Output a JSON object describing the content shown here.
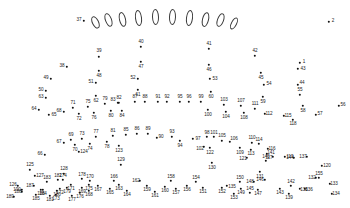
{
  "puzzle": {
    "title": "Connect the Dots Puzzle",
    "background_color": "#ffffff",
    "dot_color": "#111111",
    "label_color": "#1a1a1a",
    "outline_color": "#3a3a3a",
    "dot_count": 190,
    "shape_count": 10,
    "shapes": [
      {
        "name": "oval-1",
        "x": 95,
        "y": 22,
        "w": 6.5,
        "h": 13,
        "rot": -26
      },
      {
        "name": "oval-2",
        "x": 108,
        "y": 20,
        "w": 6.5,
        "h": 14,
        "rot": -20
      },
      {
        "name": "oval-3",
        "x": 122,
        "y": 19,
        "w": 6.8,
        "h": 15,
        "rot": -13
      },
      {
        "name": "oval-4",
        "x": 138,
        "y": 18,
        "w": 7.0,
        "h": 16,
        "rot": -7
      },
      {
        "name": "oval-5",
        "x": 155,
        "y": 17,
        "w": 7.0,
        "h": 16,
        "rot": -2
      },
      {
        "name": "oval-6",
        "x": 172,
        "y": 17,
        "w": 7.0,
        "h": 16,
        "rot": 2
      },
      {
        "name": "oval-7",
        "x": 189,
        "y": 18,
        "w": 7.0,
        "h": 16,
        "rot": 7
      },
      {
        "name": "oval-8",
        "x": 205,
        "y": 19,
        "w": 6.8,
        "h": 15,
        "rot": 13
      },
      {
        "name": "oval-9",
        "x": 220,
        "y": 20,
        "w": 6.5,
        "h": 14,
        "rot": 20
      },
      {
        "name": "oval-10",
        "x": 234,
        "y": 23,
        "w": 6.2,
        "h": 13,
        "rot": 27
      }
    ],
    "dots": [
      {
        "n": 1,
        "x": 300,
        "y": 63,
        "lx": 304,
        "ly": 61.5
      },
      {
        "n": 2,
        "x": 329,
        "y": 22,
        "lx": 333,
        "ly": 20.5
      },
      {
        "n": 37,
        "x": 84,
        "y": 21,
        "lx": 79,
        "ly": 20
      },
      {
        "n": 38,
        "x": 67,
        "y": 67,
        "lx": 62,
        "ly": 66
      },
      {
        "n": 39,
        "x": 99,
        "y": 57,
        "lx": 99,
        "ly": 51
      },
      {
        "n": 40,
        "x": 141,
        "y": 47,
        "lx": 141,
        "ly": 42
      },
      {
        "n": 41,
        "x": 209,
        "y": 49,
        "lx": 209,
        "ly": 44
      },
      {
        "n": 42,
        "x": 255,
        "y": 56,
        "lx": 255,
        "ly": 51
      },
      {
        "n": 43,
        "x": 298,
        "y": 69,
        "lx": 303,
        "ly": 69
      },
      {
        "n": 44,
        "x": 298,
        "y": 85,
        "lx": 302,
        "ly": 83
      },
      {
        "n": 45,
        "x": 261,
        "y": 73,
        "lx": 261,
        "ly": 78
      },
      {
        "n": 46,
        "x": 209,
        "y": 65,
        "lx": 209,
        "ly": 70
      },
      {
        "n": 47,
        "x": 141,
        "y": 62,
        "lx": 141,
        "ly": 67
      },
      {
        "n": 48,
        "x": 99,
        "y": 71,
        "lx": 99,
        "ly": 76
      },
      {
        "n": 49,
        "x": 51,
        "y": 79,
        "lx": 46,
        "ly": 78
      },
      {
        "n": 50,
        "x": 46,
        "y": 91,
        "lx": 41,
        "ly": 90
      },
      {
        "n": 51,
        "x": 96,
        "y": 83,
        "lx": 91,
        "ly": 82
      },
      {
        "n": 52,
        "x": 138,
        "y": 79,
        "lx": 133,
        "ly": 78
      },
      {
        "n": 53,
        "x": 210,
        "y": 79,
        "lx": 215,
        "ly": 79
      },
      {
        "n": 54,
        "x": 264,
        "y": 85,
        "lx": 269,
        "ly": 84
      },
      {
        "n": 55,
        "x": 300,
        "y": 95,
        "lx": 300,
        "ly": 90
      },
      {
        "n": 56,
        "x": 339,
        "y": 106,
        "lx": 343,
        "ly": 105
      },
      {
        "n": 57,
        "x": 316,
        "y": 115,
        "lx": 320,
        "ly": 114
      },
      {
        "n": 58,
        "x": 303,
        "y": 106,
        "lx": 303,
        "ly": 111
      },
      {
        "n": 59,
        "x": 263,
        "y": 97,
        "lx": 263,
        "ly": 102
      },
      {
        "n": 60,
        "x": 211,
        "y": 92,
        "lx": 211,
        "ly": 97
      },
      {
        "n": 61,
        "x": 138,
        "y": 90,
        "lx": 138,
        "ly": 95
      },
      {
        "n": 62,
        "x": 96,
        "y": 96,
        "lx": 96,
        "ly": 101
      },
      {
        "n": 63,
        "x": 46,
        "y": 98,
        "lx": 41,
        "ly": 97
      },
      {
        "n": 64,
        "x": 39,
        "y": 110,
        "lx": 34,
        "ly": 109
      },
      {
        "n": 65,
        "x": 49,
        "y": 115,
        "lx": 54,
        "ly": 115
      },
      {
        "n": 66,
        "x": 45,
        "y": 155,
        "lx": 40,
        "ly": 154
      },
      {
        "n": 67,
        "x": 64,
        "y": 143,
        "lx": 59,
        "ly": 142
      },
      {
        "n": 68,
        "x": 64,
        "y": 112,
        "lx": 59,
        "ly": 111
      },
      {
        "n": 69,
        "x": 71,
        "y": 140,
        "lx": 71,
        "ly": 135
      },
      {
        "n": 70,
        "x": 75,
        "y": 145,
        "lx": 75,
        "ly": 150
      },
      {
        "n": 71,
        "x": 73,
        "y": 108,
        "lx": 73,
        "ly": 103
      },
      {
        "n": 72,
        "x": 79,
        "y": 114,
        "lx": 79,
        "ly": 119
      },
      {
        "n": 73,
        "x": 82,
        "y": 139,
        "lx": 82,
        "ly": 134
      },
      {
        "n": 74,
        "x": 90,
        "y": 144,
        "lx": 90,
        "ly": 149
      },
      {
        "n": 75,
        "x": 88,
        "y": 107,
        "lx": 88,
        "ly": 102
      },
      {
        "n": 76,
        "x": 94,
        "y": 113,
        "lx": 94,
        "ly": 118
      },
      {
        "n": 77,
        "x": 96,
        "y": 137,
        "lx": 96,
        "ly": 132
      },
      {
        "n": 78,
        "x": 107,
        "y": 142,
        "lx": 107,
        "ly": 147
      },
      {
        "n": 79,
        "x": 105,
        "y": 104,
        "lx": 105,
        "ly": 99
      },
      {
        "n": 80,
        "x": 111,
        "y": 111,
        "lx": 111,
        "ly": 116
      },
      {
        "n": 81,
        "x": 113,
        "y": 136,
        "lx": 113,
        "ly": 131
      },
      {
        "n": 82,
        "x": 119,
        "y": 103,
        "lx": 119,
        "ly": 98
      },
      {
        "n": 83,
        "x": 118,
        "y": 103,
        "lx": 113,
        "ly": 100
      },
      {
        "n": 84,
        "x": 122,
        "y": 111,
        "lx": 122,
        "ly": 116
      },
      {
        "n": 85,
        "x": 126,
        "y": 135,
        "lx": 126,
        "ly": 130
      },
      {
        "n": 86,
        "x": 137,
        "y": 134,
        "lx": 137,
        "ly": 129
      },
      {
        "n": 87,
        "x": 135,
        "y": 102,
        "lx": 135,
        "ly": 97
      },
      {
        "n": 88,
        "x": 145,
        "y": 102,
        "lx": 145,
        "ly": 97
      },
      {
        "n": 89,
        "x": 148,
        "y": 134,
        "lx": 148,
        "ly": 129
      },
      {
        "n": 90,
        "x": 157,
        "y": 138,
        "lx": 161,
        "ly": 137
      },
      {
        "n": 91,
        "x": 158,
        "y": 102,
        "lx": 158,
        "ly": 97
      },
      {
        "n": 92,
        "x": 167,
        "y": 102,
        "lx": 167,
        "ly": 97
      },
      {
        "n": 93,
        "x": 172,
        "y": 137,
        "lx": 172,
        "ly": 132
      },
      {
        "n": 94,
        "x": 180,
        "y": 141,
        "lx": 180,
        "ly": 146
      },
      {
        "n": 95,
        "x": 180,
        "y": 102,
        "lx": 180,
        "ly": 97
      },
      {
        "n": 96,
        "x": 189,
        "y": 102,
        "lx": 189,
        "ly": 97
      },
      {
        "n": 97,
        "x": 193,
        "y": 139,
        "lx": 198,
        "ly": 139
      },
      {
        "n": 98,
        "x": 207,
        "y": 137,
        "lx": 207,
        "ly": 133
      },
      {
        "n": 99,
        "x": 201,
        "y": 102,
        "lx": 201,
        "ly": 97
      },
      {
        "n": 100,
        "x": 208,
        "y": 110,
        "lx": 208,
        "ly": 115
      },
      {
        "n": 101,
        "x": 214,
        "y": 137,
        "lx": 214,
        "ly": 133
      },
      {
        "n": 102,
        "x": 204,
        "y": 147,
        "lx": 200,
        "ly": 149
      },
      {
        "n": 103,
        "x": 224,
        "y": 105,
        "lx": 224,
        "ly": 100
      },
      {
        "n": 104,
        "x": 226,
        "y": 112,
        "lx": 226,
        "ly": 117
      },
      {
        "n": 105,
        "x": 222,
        "y": 141,
        "lx": 222,
        "ly": 136
      },
      {
        "n": 106,
        "x": 230,
        "y": 142,
        "lx": 234,
        "ly": 139
      },
      {
        "n": 107,
        "x": 241,
        "y": 106,
        "lx": 241,
        "ly": 101
      },
      {
        "n": 108,
        "x": 244,
        "y": 113,
        "lx": 244,
        "ly": 118
      },
      {
        "n": 109,
        "x": 240,
        "y": 148,
        "lx": 240,
        "ly": 153
      },
      {
        "n": 110,
        "x": 252,
        "y": 143,
        "lx": 252,
        "ly": 138
      },
      {
        "n": 111,
        "x": 255,
        "y": 109,
        "lx": 255,
        "ly": 104
      },
      {
        "n": 112,
        "x": 265,
        "y": 114,
        "lx": 269,
        "ly": 114
      },
      {
        "n": 113,
        "x": 251,
        "y": 150,
        "lx": 251,
        "ly": 154
      },
      {
        "n": 114,
        "x": 259,
        "y": 144,
        "lx": 259,
        "ly": 140
      },
      {
        "n": 115,
        "x": 284,
        "y": 116,
        "lx": 288,
        "ly": 116
      },
      {
        "n": 116,
        "x": 268,
        "y": 149,
        "lx": 272,
        "ly": 149
      },
      {
        "n": 117,
        "x": 273,
        "y": 157,
        "lx": 269,
        "ly": 158
      },
      {
        "n": 118,
        "x": 293,
        "y": 120,
        "lx": 293,
        "ly": 124
      },
      {
        "n": 119,
        "x": 285,
        "y": 157,
        "lx": 290,
        "ly": 157
      },
      {
        "n": 120,
        "x": 322,
        "y": 166,
        "lx": 327,
        "ly": 166
      },
      {
        "n": 121,
        "x": 247,
        "y": 158,
        "lx": 243,
        "ly": 159
      },
      {
        "n": 122,
        "x": 210,
        "y": 148,
        "lx": 210,
        "ly": 153
      },
      {
        "n": 123,
        "x": 119,
        "y": 146,
        "lx": 119,
        "ly": 151
      },
      {
        "n": 124,
        "x": 79,
        "y": 152,
        "lx": 84,
        "ly": 152
      },
      {
        "n": 125,
        "x": 30,
        "y": 170,
        "lx": 30,
        "ly": 165
      },
      {
        "n": 126,
        "x": 18,
        "y": 186,
        "lx": 13,
        "ly": 185
      },
      {
        "n": 127,
        "x": 35,
        "y": 176,
        "lx": 40,
        "ly": 176
      },
      {
        "n": 128,
        "x": 64,
        "y": 174,
        "lx": 64,
        "ly": 169
      },
      {
        "n": 129,
        "x": 121,
        "y": 165,
        "lx": 121,
        "ly": 160
      },
      {
        "n": 130,
        "x": 212,
        "y": 163,
        "lx": 212,
        "ly": 168
      },
      {
        "n": 131,
        "x": 260,
        "y": 172,
        "lx": 260,
        "ly": 177
      },
      {
        "n": 132,
        "x": 316,
        "y": 178,
        "lx": 312,
        "ly": 178
      },
      {
        "n": 133,
        "x": 330,
        "y": 184,
        "lx": 334,
        "ly": 184
      },
      {
        "n": 134,
        "x": 332,
        "y": 194,
        "lx": 336,
        "ly": 194
      },
      {
        "n": 135,
        "x": 227,
        "y": 186,
        "lx": 232,
        "ly": 187
      },
      {
        "n": 136,
        "x": 305,
        "y": 189,
        "lx": 309,
        "ly": 190
      },
      {
        "n": 137,
        "x": 307,
        "y": 157,
        "lx": 303,
        "ly": 157
      },
      {
        "n": 138,
        "x": 300,
        "y": 189,
        "lx": 304,
        "ly": 190
      },
      {
        "n": 139,
        "x": 289,
        "y": 194,
        "lx": 289,
        "ly": 198
      },
      {
        "n": 140,
        "x": 266,
        "y": 161,
        "lx": 266,
        "ly": 157
      },
      {
        "n": 141,
        "x": 267,
        "y": 154,
        "lx": 271,
        "ly": 153
      },
      {
        "n": 142,
        "x": 291,
        "y": 186,
        "lx": 291,
        "ly": 182
      },
      {
        "n": 143,
        "x": 280,
        "y": 189,
        "lx": 280,
        "ly": 193
      },
      {
        "n": 144,
        "x": 294,
        "y": 158,
        "lx": 290,
        "ly": 158
      },
      {
        "n": 145,
        "x": 250,
        "y": 193,
        "lx": 250,
        "ly": 189
      },
      {
        "n": 146,
        "x": 265,
        "y": 180,
        "lx": 260,
        "ly": 180
      },
      {
        "n": 147,
        "x": 258,
        "y": 190,
        "lx": 258,
        "ly": 194
      },
      {
        "n": 148,
        "x": 254,
        "y": 182,
        "lx": 250,
        "ly": 182
      },
      {
        "n": 149,
        "x": 241,
        "y": 189,
        "lx": 241,
        "ly": 193
      },
      {
        "n": 150,
        "x": 240,
        "y": 182,
        "lx": 240,
        "ly": 178
      },
      {
        "n": 151,
        "x": 203,
        "y": 188,
        "lx": 203,
        "ly": 192
      },
      {
        "n": 152,
        "x": 222,
        "y": 188,
        "lx": 222,
        "ly": 192
      },
      {
        "n": 153,
        "x": 234,
        "y": 194,
        "lx": 234,
        "ly": 198
      },
      {
        "n": 154,
        "x": 196,
        "y": 182,
        "lx": 196,
        "ly": 178
      },
      {
        "n": 155,
        "x": 319,
        "y": 178,
        "lx": 319,
        "ly": 174
      },
      {
        "n": 156,
        "x": 187,
        "y": 186,
        "lx": 187,
        "ly": 190
      },
      {
        "n": 157,
        "x": 176,
        "y": 189,
        "lx": 176,
        "ly": 193
      },
      {
        "n": 158,
        "x": 171,
        "y": 181,
        "lx": 171,
        "ly": 177
      },
      {
        "n": 159,
        "x": 147,
        "y": 186,
        "lx": 147,
        "ly": 190
      },
      {
        "n": 160,
        "x": 165,
        "y": 187,
        "lx": 165,
        "ly": 191
      },
      {
        "n": 161,
        "x": 155,
        "y": 192,
        "lx": 155,
        "ly": 196
      },
      {
        "n": 162,
        "x": 140,
        "y": 181,
        "lx": 136,
        "ly": 181
      },
      {
        "n": 163,
        "x": 119,
        "y": 185,
        "lx": 119,
        "ly": 189
      },
      {
        "n": 164,
        "x": 127,
        "y": 191,
        "lx": 127,
        "ly": 195
      },
      {
        "n": 165,
        "x": 110,
        "y": 189,
        "lx": 110,
        "ly": 193
      },
      {
        "n": 166,
        "x": 114,
        "y": 181,
        "lx": 114,
        "ly": 177
      },
      {
        "n": 167,
        "x": 98,
        "y": 186,
        "lx": 98,
        "ly": 190
      },
      {
        "n": 168,
        "x": 89,
        "y": 191,
        "lx": 89,
        "ly": 195
      },
      {
        "n": 169,
        "x": 82,
        "y": 188,
        "lx": 82,
        "ly": 192
      },
      {
        "n": 170,
        "x": 90,
        "y": 181,
        "lx": 90,
        "ly": 177
      },
      {
        "n": 171,
        "x": 71,
        "y": 185,
        "lx": 71,
        "ly": 189
      },
      {
        "n": 172,
        "x": 60,
        "y": 189,
        "lx": 60,
        "ly": 193
      },
      {
        "n": 173,
        "x": 56,
        "y": 195,
        "lx": 56,
        "ly": 199
      },
      {
        "n": 174,
        "x": 63,
        "y": 180,
        "lx": 63,
        "ly": 176
      },
      {
        "n": 175,
        "x": 89,
        "y": 185,
        "lx": 89,
        "ly": 189
      },
      {
        "n": 176,
        "x": 80,
        "y": 193,
        "lx": 80,
        "ly": 197
      },
      {
        "n": 177,
        "x": 72,
        "y": 196,
        "lx": 72,
        "ly": 200
      },
      {
        "n": 178,
        "x": 82,
        "y": 179,
        "lx": 82,
        "ly": 175
      },
      {
        "n": 179,
        "x": 67,
        "y": 188,
        "lx": 67,
        "ly": 192
      },
      {
        "n": 180,
        "x": 57,
        "y": 191,
        "lx": 57,
        "ly": 195
      },
      {
        "n": 181,
        "x": 50,
        "y": 196,
        "lx": 50,
        "ly": 200
      },
      {
        "n": 182,
        "x": 58,
        "y": 180,
        "lx": 58,
        "ly": 176
      },
      {
        "n": 183,
        "x": 47,
        "y": 182,
        "lx": 47,
        "ly": 178
      },
      {
        "n": 184,
        "x": 43,
        "y": 190,
        "lx": 43,
        "ly": 194
      },
      {
        "n": 185,
        "x": 36,
        "y": 195,
        "lx": 36,
        "ly": 199
      },
      {
        "n": 186,
        "x": 41,
        "y": 190,
        "lx": 41,
        "ly": 194
      },
      {
        "n": 187,
        "x": 34,
        "y": 186,
        "lx": 30,
        "ly": 186
      },
      {
        "n": 188,
        "x": 22,
        "y": 192,
        "lx": 18,
        "ly": 192
      },
      {
        "n": 189,
        "x": 14,
        "y": 197,
        "lx": 10,
        "ly": 197
      },
      {
        "n": 190,
        "x": 22,
        "y": 190,
        "lx": 17,
        "ly": 190
      }
    ]
  }
}
